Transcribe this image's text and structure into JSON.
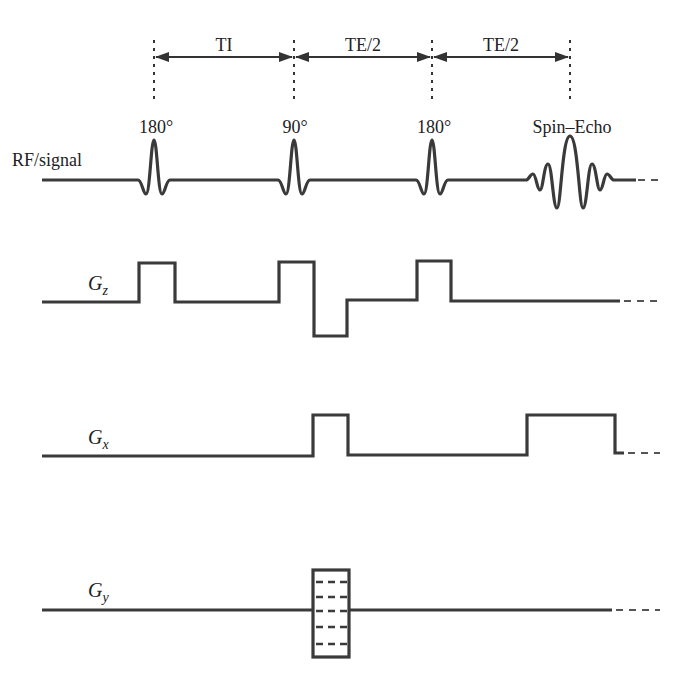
{
  "figure": {
    "type": "pulse-sequence-diagram",
    "colors": {
      "line": "#3a3a3a",
      "text": "#222222",
      "background": "#ffffff"
    }
  },
  "timing_intervals": [
    {
      "label": "TI",
      "from": "180° inversion",
      "to": "90°"
    },
    {
      "label": "TE/2",
      "from": "90°",
      "to": "180° refocusing"
    },
    {
      "label": "TE/2",
      "from": "180° refocusing",
      "to": "Spin–Echo"
    }
  ],
  "pulse_labels": [
    "180°",
    "90°",
    "180°",
    "Spin–Echo"
  ],
  "rows": [
    {
      "id": "rf",
      "label": "RF/signal",
      "label_main": "RF/signal",
      "label_sub": ""
    },
    {
      "id": "gz",
      "label": "Gz",
      "label_main": "G",
      "label_sub": "z"
    },
    {
      "id": "gx",
      "label": "Gx",
      "label_main": "G",
      "label_sub": "x"
    },
    {
      "id": "gy",
      "label": "Gy",
      "label_main": "G",
      "label_sub": "y"
    }
  ],
  "events": {
    "rf": [
      "180° pulse",
      "90° pulse",
      "180° pulse",
      "spin echo"
    ],
    "gz": [
      "slice-select (inversion)",
      "slice-select (90°)",
      "slice rephasing lobe (negative)",
      "slice-select (180°)"
    ],
    "gx": [
      "readout prephasing lobe",
      "readout (frequency encoding)"
    ],
    "gy": [
      "phase-encoding table"
    ]
  }
}
